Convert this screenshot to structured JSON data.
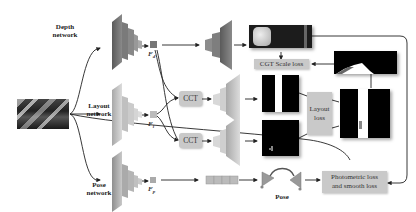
{
  "figure": {
    "input": {
      "icon": "road-scene-image"
    },
    "branches": [
      {
        "label_line1": "Depth",
        "label_line2": "network",
        "feature": "F",
        "feature_sub": "d"
      },
      {
        "label_line1": "Layout",
        "label_line2": "network",
        "feature": "F",
        "feature_sub": "l"
      },
      {
        "label_line1": "Pose",
        "label_line2": "network",
        "feature": "F",
        "feature_sub": "p"
      }
    ],
    "modules": {
      "cct_top": "CCT",
      "cct_bottom": "CCT",
      "pose_label": "Pose"
    },
    "losses": {
      "cgt_scale": "CGT Scale loss",
      "layout_line1": "Layout",
      "layout_line2": "loss",
      "photometric_line1": "Photometric loss",
      "photometric_line2": "and smooth loss"
    },
    "colors": {
      "depth_network": "#6e6e6e",
      "layout_network": "#bdbdbd",
      "pose_network": "#a9a9a9",
      "loss_box": "#c9c9c9",
      "wire": "#222222"
    }
  }
}
